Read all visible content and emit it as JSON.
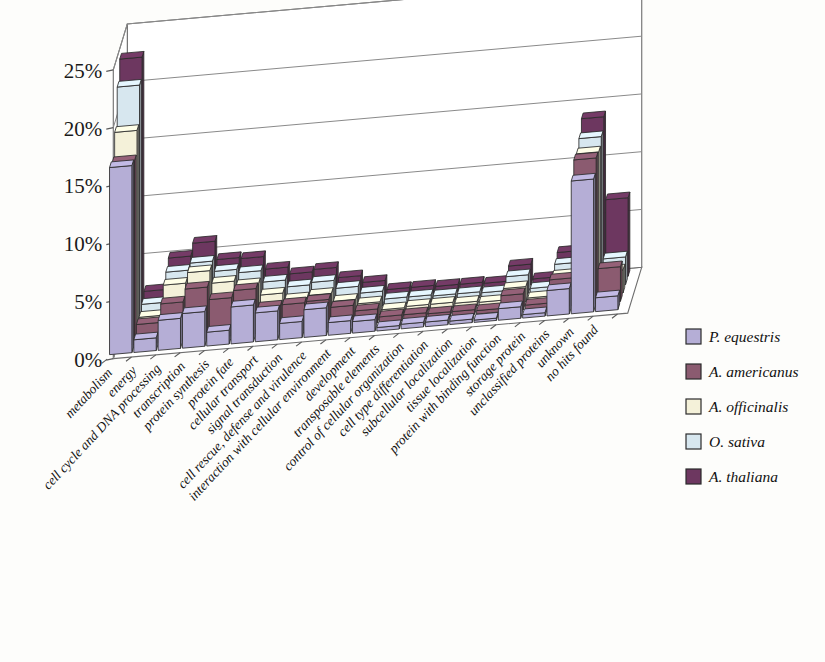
{
  "chart_data": {
    "type": "bar",
    "title": "",
    "subtitle": "",
    "xlabel": "",
    "ylabel": "",
    "ylim": [
      0,
      25
    ],
    "ytick_labels": [
      "0%",
      "5%",
      "10%",
      "15%",
      "20%",
      "25%"
    ],
    "ytick_values": [
      0,
      5,
      10,
      15,
      20,
      25
    ],
    "grid": true,
    "projection": "3d",
    "legend_position": "right",
    "categories": [
      "metabolism",
      "energy",
      "cell cycle and DNA processing",
      "transcription",
      "protein synthesis",
      "protein fate",
      "cellular transport",
      "signal transduction",
      "cell rescue, defense and virulence",
      "interaction with cellular environment",
      "development",
      "transposable elements",
      "control of cellular organization",
      "cell type differentiation",
      "subcellular localization",
      "tissue localization",
      "protein with binding function",
      "storage protein",
      "unclassified proteins",
      "unknown",
      "no hits found"
    ],
    "series": [
      {
        "name": "P. equestris",
        "color": "#b5aed6",
        "values": [
          16.2,
          1.1,
          2.6,
          3.0,
          1.2,
          3.2,
          2.5,
          1.4,
          2.4,
          1.1,
          1.0,
          0.3,
          0.4,
          0.4,
          0.3,
          0.2,
          1.0,
          0.3,
          2.2,
          11.5,
          1.2
        ]
      },
      {
        "name": "A. americanus",
        "color": "#8b5b70",
        "values": [
          15.9,
          1.7,
          3.3,
          4.4,
          3.3,
          3.9,
          2.2,
          2.3,
          2.4,
          1.7,
          1.2,
          0.5,
          0.5,
          0.4,
          0.4,
          0.3,
          1.4,
          0.4,
          2.4,
          12.6,
          3.0
        ]
      },
      {
        "name": "A. officinalis",
        "color": "#f4f1d9",
        "values": [
          17.8,
          1.6,
          4.2,
          5.1,
          4.0,
          3.6,
          2.6,
          2.0,
          2.2,
          1.5,
          1.1,
          0.4,
          0.5,
          0.5,
          0.4,
          0.3,
          1.3,
          0.3,
          2.0,
          12.4,
          2.0
        ]
      },
      {
        "name": "O. sativa",
        "color": "#d7e7ef",
        "values": [
          21.0,
          2.0,
          4.6,
          5.2,
          4.3,
          4.0,
          3.0,
          2.4,
          2.6,
          1.9,
          1.3,
          0.6,
          0.6,
          0.5,
          0.5,
          0.4,
          1.6,
          0.4,
          2.3,
          13.0,
          2.4
        ]
      },
      {
        "name": "A. thaliana",
        "color": "#6d3760",
        "values": [
          22.7,
          2.4,
          5.1,
          6.2,
          4.6,
          4.5,
          3.4,
          2.8,
          3.0,
          2.1,
          1.5,
          0.7,
          0.7,
          0.6,
          0.6,
          0.5,
          1.8,
          0.5,
          2.6,
          14.0,
          6.8
        ]
      }
    ]
  },
  "legend": {
    "items": [
      {
        "label": "P. equestris",
        "color": "#b5aed6"
      },
      {
        "label": "A. americanus",
        "color": "#8b5b70"
      },
      {
        "label": "A. officinalis",
        "color": "#f4f1d9"
      },
      {
        "label": "O. sativa",
        "color": "#d7e7ef"
      },
      {
        "label": "A. thaliana",
        "color": "#6d3760"
      }
    ]
  }
}
